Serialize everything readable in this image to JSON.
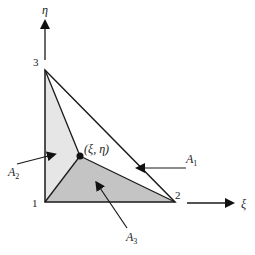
{
  "diagram": {
    "axes": {
      "horizontal_label": "ξ",
      "vertical_label": "η"
    },
    "vertices": [
      {
        "id": "1",
        "label": "1"
      },
      {
        "id": "2",
        "label": "2"
      },
      {
        "id": "3",
        "label": "3"
      }
    ],
    "interior_point": {
      "label": "(ξ, η)"
    },
    "areas": [
      {
        "id": "A1",
        "base": "A",
        "sub": "1",
        "color": "#ffffff"
      },
      {
        "id": "A2",
        "base": "A",
        "sub": "2",
        "color": "#e6e6e6"
      },
      {
        "id": "A3",
        "base": "A",
        "sub": "3",
        "color": "#c4c4c4"
      }
    ],
    "colors": {
      "line": "#1a1a1a",
      "light_fill": "#e6e6e6",
      "dark_fill": "#c4c4c4"
    }
  }
}
